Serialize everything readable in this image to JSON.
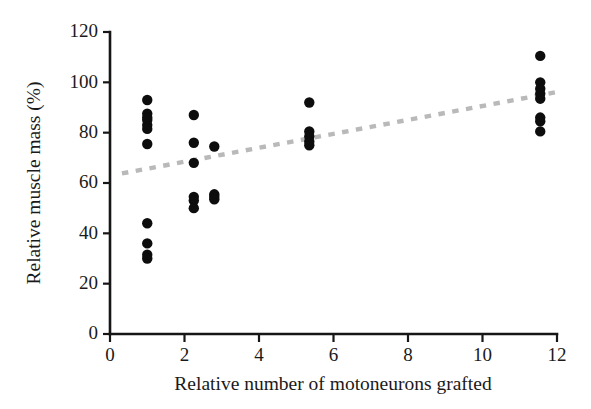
{
  "figure": {
    "background_color": "#ffffff",
    "point_color": "#0d0d0d",
    "trendline_color": "#b9b9b9",
    "axis_color": "#161616"
  },
  "chart_data": {
    "type": "scatter",
    "title": "",
    "xlabel": "Relative number of motoneurons grafted",
    "ylabel": "Relative muscle mass (%)",
    "xlim": [
      0,
      12
    ],
    "ylim": [
      0,
      120
    ],
    "xticks": [
      0,
      2,
      4,
      6,
      8,
      10,
      12
    ],
    "yticks": [
      0,
      20,
      40,
      60,
      80,
      100,
      120
    ],
    "xtick_labels": [
      "0",
      "2",
      "4",
      "6",
      "8",
      "10",
      "12"
    ],
    "ytick_labels": [
      "0",
      "20",
      "40",
      "60",
      "80",
      "100",
      "120"
    ],
    "grid": false,
    "legend": "none",
    "marker": "filled-circle",
    "marker_size_px": 5.2,
    "series": [
      {
        "name": "Muscle mass vs motoneurons grafted",
        "x": [
          1.0,
          1.0,
          1.0,
          1.0,
          1.0,
          1.0,
          1.0,
          1.0,
          1.0,
          1.0,
          1.0,
          2.25,
          2.25,
          2.25,
          2.25,
          2.25,
          2.25,
          2.8,
          2.8,
          2.8,
          2.8,
          5.35,
          5.35,
          5.35,
          5.35,
          5.35,
          11.55,
          11.55,
          11.55,
          11.55,
          11.55,
          11.55,
          11.55,
          11.55
        ],
        "y": [
          93.0,
          87.5,
          85.0,
          83.0,
          81.5,
          75.5,
          44.0,
          36.0,
          31.5,
          30.0,
          86.0,
          87.0,
          76.0,
          68.0,
          54.5,
          53.0,
          50.0,
          74.5,
          55.5,
          54.5,
          53.5,
          92.0,
          80.5,
          78.5,
          76.5,
          75.0,
          110.5,
          100.0,
          97.5,
          95.5,
          93.5,
          86.0,
          84.5,
          80.5
        ]
      }
    ],
    "trendline": {
      "type": "dotted-linear",
      "x_start": 0.32,
      "y_start": 63.8,
      "x_end": 11.95,
      "y_end": 96.0
    }
  }
}
